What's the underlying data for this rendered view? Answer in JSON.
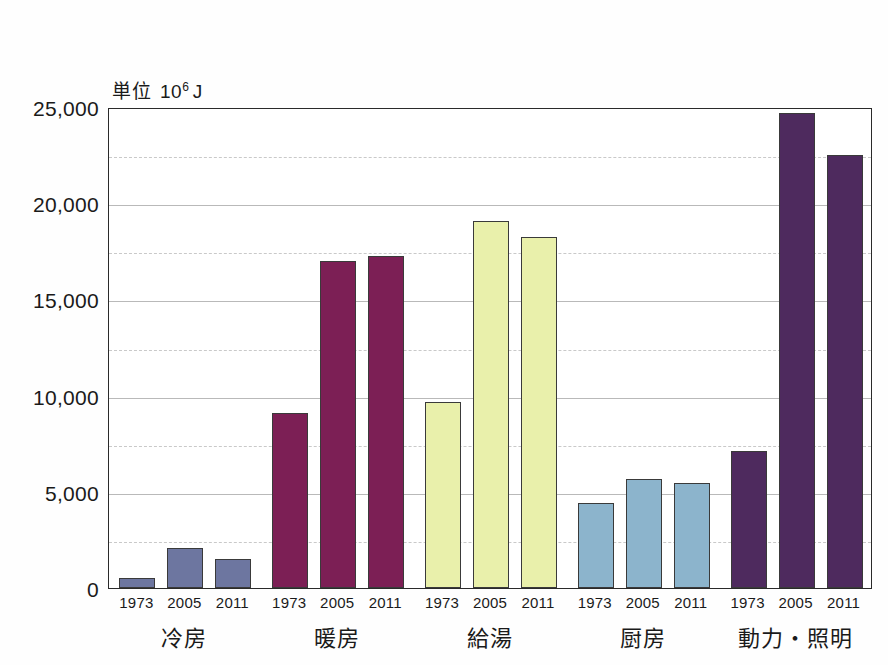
{
  "unit_label": {
    "prefix": "単位",
    "base": "10",
    "exponent": "6",
    "unit": "J",
    "full": "単位 10⁶ J"
  },
  "chart_data": {
    "type": "bar",
    "title": "",
    "subtitle": "",
    "xlabel": "",
    "ylabel": "単位 10⁶ J",
    "ylim": [
      0,
      25000
    ],
    "ytick_labels": [
      "0",
      "5,000",
      "10,000",
      "15,000",
      "20,000",
      "25,000"
    ],
    "ytick_values": [
      0,
      5000,
      10000,
      15000,
      20000,
      25000
    ],
    "minor_gridline_values": [
      2500,
      7500,
      12500,
      17500,
      22500
    ],
    "grid": true,
    "legend_position": "none",
    "categories": [
      "冷房",
      "暖房",
      "給湯",
      "厨房",
      "動力・照明"
    ],
    "x": [
      "1973",
      "2005",
      "2011"
    ],
    "series": [
      {
        "name": "1973",
        "values": [
          500,
          9100,
          9650,
          4400,
          7100
        ]
      },
      {
        "name": "2005",
        "values": [
          2100,
          17000,
          19100,
          5650,
          24700
        ]
      },
      {
        "name": "2011",
        "values": [
          1500,
          17250,
          18250,
          5450,
          22500
        ]
      }
    ],
    "groups": [
      {
        "label": "冷房",
        "color": "#6d76a0",
        "bars": [
          {
            "year": "1973",
            "value": 500
          },
          {
            "year": "2005",
            "value": 2100
          },
          {
            "year": "2011",
            "value": 1500
          }
        ]
      },
      {
        "label": "暖房",
        "color": "#7c1f55",
        "bars": [
          {
            "year": "1973",
            "value": 9100
          },
          {
            "year": "2005",
            "value": 17000
          },
          {
            "year": "2011",
            "value": 17250
          }
        ]
      },
      {
        "label": "給湯",
        "color": "#e9f0ab",
        "bars": [
          {
            "year": "1973",
            "value": 9650
          },
          {
            "year": "2005",
            "value": 19100
          },
          {
            "year": "2011",
            "value": 18250
          }
        ]
      },
      {
        "label": "厨房",
        "color": "#8cb4cc",
        "bars": [
          {
            "year": "1973",
            "value": 4400
          },
          {
            "year": "2005",
            "value": 5650
          },
          {
            "year": "2011",
            "value": 5450
          }
        ]
      },
      {
        "label": "動力・照明",
        "color": "#4e2a5e",
        "bars": [
          {
            "year": "1973",
            "value": 7100
          },
          {
            "year": "2005",
            "value": 24700
          },
          {
            "year": "2011",
            "value": 22500
          }
        ]
      }
    ]
  },
  "colors": {
    "axis": "#2a2a2a",
    "gridline": "#b9b9b9",
    "background": "#ffffff",
    "text": "#1a1a1a"
  }
}
